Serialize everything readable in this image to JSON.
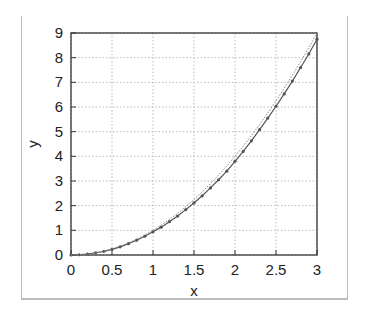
{
  "chart_data": {
    "type": "line",
    "title": "",
    "xlabel": "x",
    "ylabel": "y",
    "xlim": [
      0,
      3
    ],
    "ylim": [
      0,
      9
    ],
    "grid": true,
    "legend": null,
    "x_ticks": [
      "0",
      "0.5",
      "1",
      "1.5",
      "2",
      "2.5",
      "3"
    ],
    "y_ticks": [
      "0",
      "1",
      "2",
      "3",
      "4",
      "5",
      "6",
      "7",
      "8",
      "9"
    ],
    "x": [
      0,
      0.1,
      0.2,
      0.3,
      0.4,
      0.5,
      0.6,
      0.7,
      0.8,
      0.9,
      1.0,
      1.1,
      1.2,
      1.3,
      1.4,
      1.5,
      1.6,
      1.7,
      1.8,
      1.9,
      2.0,
      2.1,
      2.2,
      2.3,
      2.4,
      2.5,
      2.6,
      2.7,
      2.8,
      2.9,
      3.0
    ],
    "series": [
      {
        "name": "approximation (solid with markers)",
        "style": "solid-markers",
        "values": [
          0,
          0.01,
          0.04,
          0.09,
          0.15,
          0.23,
          0.33,
          0.46,
          0.6,
          0.76,
          0.94,
          1.13,
          1.35,
          1.58,
          1.84,
          2.11,
          2.4,
          2.72,
          3.05,
          3.4,
          3.8,
          4.2,
          4.63,
          5.08,
          5.55,
          6.03,
          6.53,
          7.05,
          7.6,
          8.15,
          8.75
        ]
      },
      {
        "name": "exact (dotted)",
        "style": "dotted",
        "values": [
          0,
          0.01,
          0.04,
          0.09,
          0.16,
          0.25,
          0.36,
          0.49,
          0.64,
          0.81,
          1.0,
          1.21,
          1.44,
          1.69,
          1.96,
          2.25,
          2.56,
          2.89,
          3.24,
          3.61,
          4.0,
          4.41,
          4.84,
          5.29,
          5.76,
          6.25,
          6.76,
          7.29,
          7.84,
          8.41,
          9.0
        ]
      }
    ]
  },
  "labels": {
    "x": "x",
    "y": "y"
  }
}
